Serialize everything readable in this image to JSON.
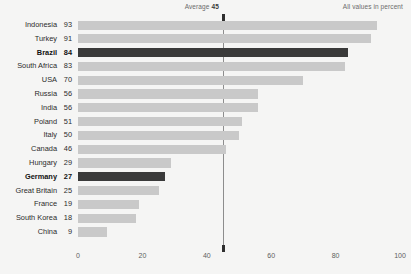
{
  "annotations": {
    "average_label": "Average",
    "average_value": "45",
    "units_note": "All values in percent"
  },
  "colors": {
    "background": "#f5f5f4",
    "bar": "#c9c9c9",
    "bar_highlight": "#3a3a3a",
    "average_line": "#8d8d8d",
    "text": "#2b2b2b"
  },
  "chart_data": {
    "type": "bar",
    "orientation": "horizontal",
    "title": "",
    "subtitle": "",
    "xlabel": "",
    "ylabel": "",
    "xlim": [
      0,
      100
    ],
    "xticks": [
      "0",
      "20",
      "40",
      "60",
      "80",
      "100"
    ],
    "grid": false,
    "legend": null,
    "annotations": [
      {
        "type": "vline",
        "label": "Average",
        "value": 45
      },
      {
        "type": "note",
        "text": "All values in percent"
      }
    ],
    "highlighted": [
      "Brazil",
      "Germany"
    ],
    "categories": [
      "Indonesia",
      "Turkey",
      "Brazil",
      "South Africa",
      "USA",
      "Russia",
      "India",
      "Poland",
      "Italy",
      "Canada",
      "Hungary",
      "Germany",
      "Great Britain",
      "France",
      "South Korea",
      "China"
    ],
    "values": [
      93,
      91,
      84,
      83,
      70,
      56,
      56,
      51,
      50,
      46,
      29,
      27,
      25,
      19,
      18,
      9
    ],
    "rows": [
      {
        "label": "Indonesia",
        "value": 93,
        "highlight": false
      },
      {
        "label": "Turkey",
        "value": 91,
        "highlight": false
      },
      {
        "label": "Brazil",
        "value": 84,
        "highlight": true
      },
      {
        "label": "South Africa",
        "value": 83,
        "highlight": false
      },
      {
        "label": "USA",
        "value": 70,
        "highlight": false
      },
      {
        "label": "Russia",
        "value": 56,
        "highlight": false
      },
      {
        "label": "India",
        "value": 56,
        "highlight": false
      },
      {
        "label": "Poland",
        "value": 51,
        "highlight": false
      },
      {
        "label": "Italy",
        "value": 50,
        "highlight": false
      },
      {
        "label": "Canada",
        "value": 46,
        "highlight": false
      },
      {
        "label": "Hungary",
        "value": 29,
        "highlight": false
      },
      {
        "label": "Germany",
        "value": 27,
        "highlight": true
      },
      {
        "label": "Great Britain",
        "value": 25,
        "highlight": false
      },
      {
        "label": "France",
        "value": 19,
        "highlight": false
      },
      {
        "label": "South Korea",
        "value": 18,
        "highlight": false
      },
      {
        "label": "China",
        "value": 9,
        "highlight": false
      }
    ]
  }
}
